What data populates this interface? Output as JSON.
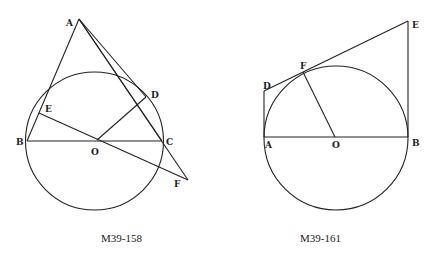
{
  "figures": [
    {
      "caption": "M39-158",
      "labels": {
        "A": "A",
        "B": "B",
        "C": "C",
        "D": "D",
        "E": "E",
        "F": "F",
        "O": "O"
      }
    },
    {
      "caption": "M39-161",
      "labels": {
        "A": "A",
        "B": "B",
        "D": "D",
        "E": "E",
        "F": "F",
        "O": "O"
      }
    }
  ],
  "colors": {
    "ink": "#222222",
    "background": "#ffffff"
  }
}
